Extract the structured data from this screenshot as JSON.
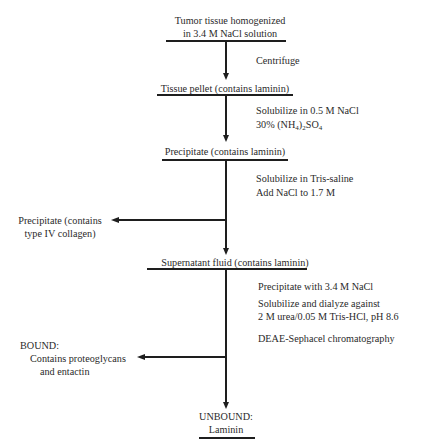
{
  "diagram": {
    "nodes": {
      "start": {
        "line1": "Tumor tissue homogenized",
        "line2": "in 3.4 M NaCl solution"
      },
      "tissue_pellet": {
        "label": "Tissue pellet (contains laminin)"
      },
      "precipitate1": {
        "label": "Precipitate (contains laminin)"
      },
      "precipitate_collagen": {
        "line1": "Precipitate (contains",
        "line2": "type IV collagen)"
      },
      "supernatant": {
        "label": "Supernatant fluid (contains laminin)"
      },
      "bound": {
        "line1": "BOUND:",
        "line2": "Contains proteoglycans",
        "line3": "and entactin"
      },
      "unbound": {
        "line1": "UNBOUND:",
        "line2": "Laminin"
      }
    },
    "steps": {
      "step1": {
        "line1": "Centrifuge"
      },
      "step2": {
        "line1": "Solubilize in 0.5 M NaCl",
        "line2_prefix": "30% (NH",
        "line2_sub1": "4",
        "line2_mid": ")",
        "line2_sub2": "2",
        "line2_suffix": "SO",
        "line2_sub3": "4"
      },
      "step3": {
        "line1": "Solubilize in Tris-saline",
        "line2": "Add NaCl to 1.7 M"
      },
      "step4": {
        "line1": "Precipitate with 3.4 M NaCl",
        "line2": "Solubilize and dialyze against",
        "line3": "2 M urea/0.05 M Tris-HCl, pH 8.6",
        "line4": "DEAE-Sephacel chromatography"
      }
    },
    "colors": {
      "line": "#1e1e1e",
      "text": "#2a2a2a",
      "background": "#ffffff"
    }
  }
}
